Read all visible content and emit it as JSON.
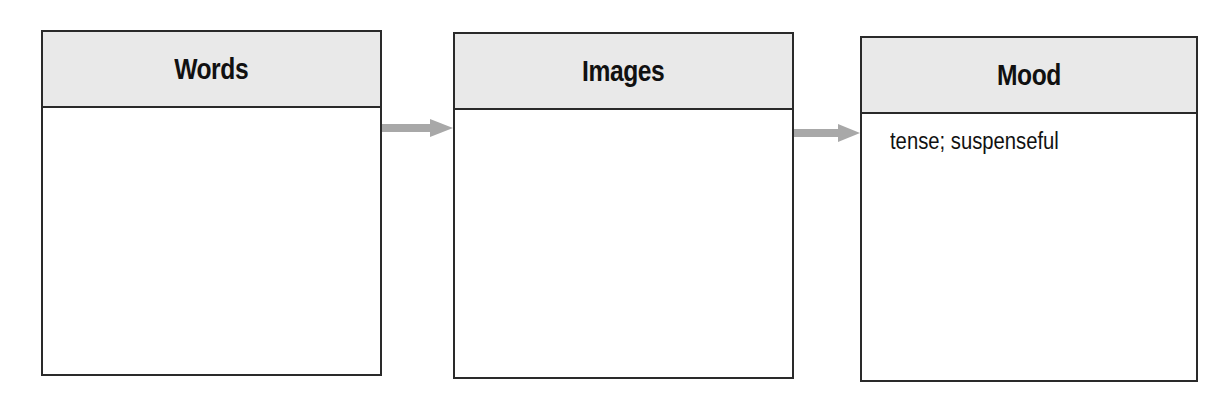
{
  "diagram": {
    "type": "flow-boxes",
    "boxes": [
      {
        "title": "Words",
        "content": ""
      },
      {
        "title": "Images",
        "content": ""
      },
      {
        "title": "Mood",
        "content": "tense; suspenseful"
      }
    ],
    "arrows": [
      {
        "from": "Words",
        "to": "Images"
      },
      {
        "from": "Images",
        "to": "Mood"
      }
    ],
    "colors": {
      "header_bg": "#e9e9e9",
      "border": "#2a2a2a",
      "arrow": "#a8a8a8"
    }
  }
}
